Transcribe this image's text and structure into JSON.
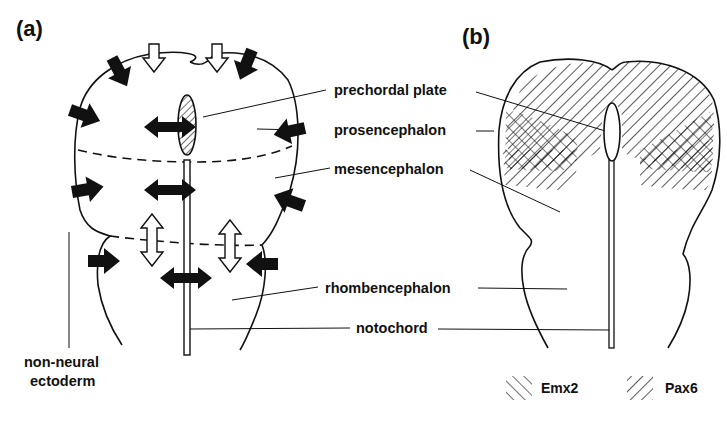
{
  "figure": {
    "panels": [
      {
        "id": "a",
        "label": "(a)"
      },
      {
        "id": "b",
        "label": "(b)"
      }
    ],
    "labels": {
      "prechordal_plate": "prechordal plate",
      "prosencephalon": "prosencephalon",
      "mesencephalon": "mesencephalon",
      "rhombencephalon": "rhombencephalon",
      "notochord": "notochord",
      "non_neural_line1": "non-neural",
      "non_neural_line2": "ectoderm"
    },
    "legend": [
      {
        "label": "Emx2",
        "pattern": "hatch-backslash"
      },
      {
        "label": "Pax6",
        "pattern": "hatch-slash"
      }
    ],
    "arrows": {
      "filled_meaning": "black arrows",
      "open_meaning": "white arrows"
    },
    "colors": {
      "ink": "#111111",
      "background": "#ffffff"
    }
  }
}
